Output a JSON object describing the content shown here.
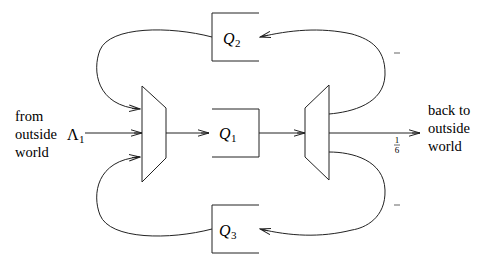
{
  "diagram": {
    "type": "queueing-network",
    "colors": {
      "stroke": "#222222",
      "text": "#000000",
      "background": "#ffffff"
    },
    "source_label": [
      "from",
      "outside",
      "world"
    ],
    "sink_label": [
      "back to",
      "outside",
      "world"
    ],
    "arrival_rate": {
      "symbol": "Λ",
      "subscript": "1"
    },
    "queues": [
      {
        "id": "Q2",
        "symbol": "Q",
        "subscript": "2"
      },
      {
        "id": "Q1",
        "symbol": "Q",
        "subscript": "1"
      },
      {
        "id": "Q3",
        "symbol": "Q",
        "subscript": "3"
      }
    ],
    "routing_probabilities": {
      "to_Q2": {
        "num": "2",
        "den": "3"
      },
      "to_outside": {
        "num": "1",
        "den": "6"
      },
      "to_Q3": {
        "num": "1",
        "den": "6"
      }
    },
    "nodes": [
      "merger",
      "splitter"
    ]
  }
}
